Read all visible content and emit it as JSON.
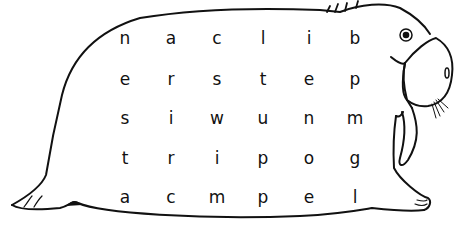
{
  "puzzle": {
    "type": "word-search",
    "figure": "walrus",
    "rows": [
      [
        "n",
        "a",
        "c",
        "l",
        "i",
        "b"
      ],
      [
        "e",
        "r",
        "s",
        "t",
        "e",
        "p"
      ],
      [
        "s",
        "i",
        "w",
        "u",
        "n",
        "m"
      ],
      [
        "t",
        "r",
        "i",
        "p",
        "o",
        "g"
      ],
      [
        "a",
        "c",
        "m",
        "p",
        "e",
        "l"
      ]
    ]
  },
  "layout": {
    "col_x": [
      125,
      171,
      217,
      263,
      309,
      355
    ],
    "row_y": [
      40,
      81,
      120,
      160,
      199
    ]
  },
  "colors": {
    "ink": "#111111",
    "background": "#ffffff"
  }
}
